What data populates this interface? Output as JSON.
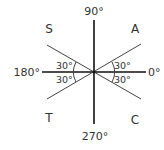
{
  "diagram": {
    "type": "quadrant-angle-diagram",
    "axis_labels": {
      "right": "0°",
      "top": "90°",
      "left": "180°",
      "bottom": "270°"
    },
    "quadrant_labels": {
      "first": "A",
      "second": "S",
      "third": "T",
      "fourth": "C"
    },
    "angle_labels": {
      "upper_right": "30°",
      "lower_right": "30°",
      "upper_left": "30°",
      "lower_left": "30°"
    },
    "colors": {
      "axis": "#111111",
      "diagonal": "#444444",
      "text": "#333333"
    }
  }
}
